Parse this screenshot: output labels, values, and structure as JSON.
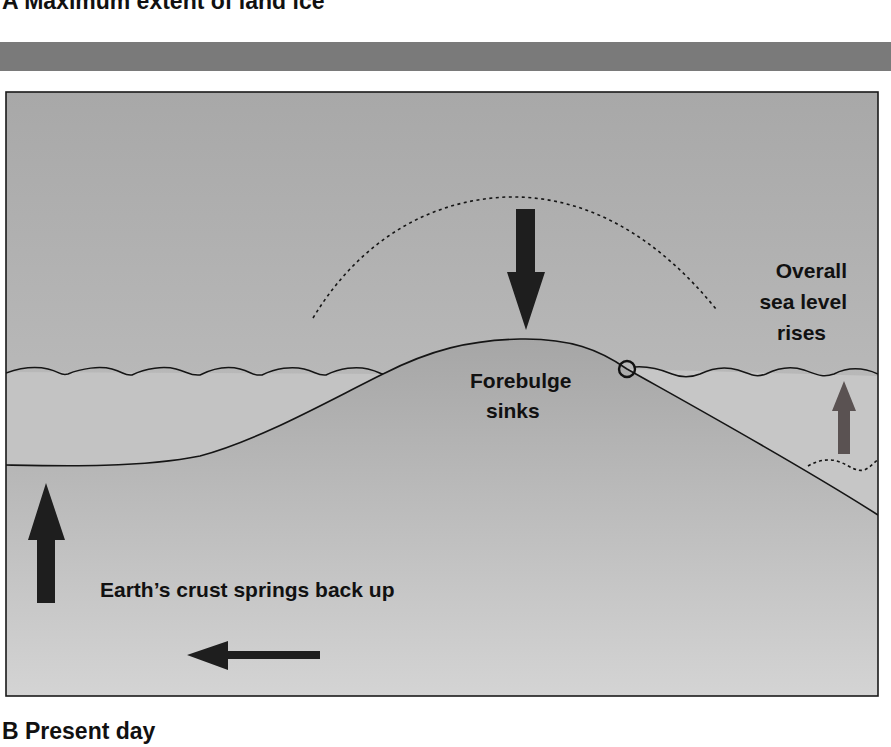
{
  "panel_a": {
    "title": "A  Maximum extent of land ice"
  },
  "panel_b": {
    "title": "B  Present day"
  },
  "labels": {
    "sea_level_line1": "Overall",
    "sea_level_line2": "sea level",
    "sea_level_line3": "rises",
    "forebulge_line1": "Forebulge",
    "forebulge_line2": "sinks",
    "crust": "Earth’s crust springs back up"
  },
  "icons": {
    "down_arrow": "arrow-down-icon",
    "up_arrow_left": "arrow-up-icon",
    "up_arrow_right": "arrow-up-icon",
    "left_arrow": "arrow-left-icon"
  },
  "colors": {
    "band": "#7a7a7a",
    "sky_top": "#a8a8a8",
    "sky_bottom": "#cacaca",
    "land_top": "#a6a6a6",
    "land_bottom": "#d4d4d4",
    "arrow_dark": "#1e1e1e",
    "arrow_right": "#5a5252"
  }
}
